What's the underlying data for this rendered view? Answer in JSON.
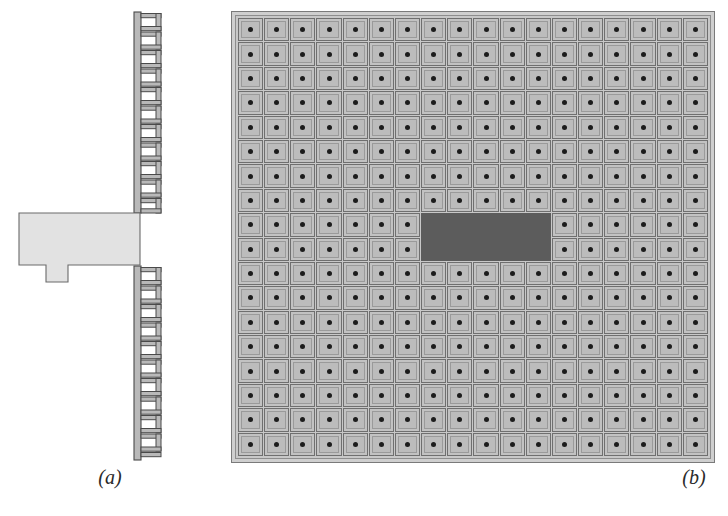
{
  "figure": {
    "type": "two-panel technical illustration",
    "background_color": "#ffffff",
    "panels": [
      {
        "id": "a",
        "caption": "(a)",
        "description": "Side cross-section view of a slotted vertical rack rail with an attached block",
        "elements": {
          "rail": {
            "name": "vertical-slotted-rail",
            "fill_color": "#b9b9b9",
            "stroke_color": "#4a4a4a",
            "spine_x": 134,
            "spine_width": 7,
            "upper_segment": {
              "top": 12,
              "bottom": 212,
              "rung_count": 11
            },
            "lower_segment": {
              "top": 266,
              "bottom": 460,
              "rung_count": 11
            },
            "rung_arm_width": 20,
            "rung_pitch": 18.5
          },
          "block": {
            "name": "attached-block",
            "fill_color": "#e2e2e2",
            "stroke_color": "#6a6a6a",
            "x": 19,
            "y": 213,
            "width": 121,
            "height": 52,
            "tab": {
              "x": 46,
              "y": 265,
              "width": 22,
              "height": 17
            }
          }
        }
      },
      {
        "id": "b",
        "caption": "(b)",
        "description": "Plan view of an 18 by 18 array of square cells each with a central dot, with one dark rectangular region near the centre",
        "elements": {
          "frame": {
            "name": "array-frame",
            "outer_fill": "#cfcfcf",
            "outer_stroke": "#7a7a7a",
            "inner_fill": "#c8c8c8",
            "inner_stroke": "#8d8d8d"
          },
          "array": {
            "name": "cell-array",
            "columns": 18,
            "rows": 18,
            "total_cells": 324,
            "cell_fill": "#c2c2c2",
            "cell_stroke": "#6f6f6f",
            "cell_inner_stroke": "#9a9a9a",
            "dot_color": "#1c1c1c"
          },
          "dark_region": {
            "name": "highlighted-region",
            "fill_color": "#5c5c5c",
            "start_column": 8,
            "end_column": 12,
            "start_row": 9,
            "end_row": 10,
            "column_span": 5,
            "row_span": 2,
            "cells_covered": 10
          }
        }
      }
    ]
  },
  "chart_data": {
    "type": "heatmap",
    "title": "",
    "xlabel": "",
    "ylabel": "",
    "columns": 18,
    "rows": 18,
    "legend": [],
    "annotations": [
      "(a)",
      "(b)"
    ],
    "values_note": "Uniform array; highlighted block covers columns 8-12, rows 9-10"
  }
}
